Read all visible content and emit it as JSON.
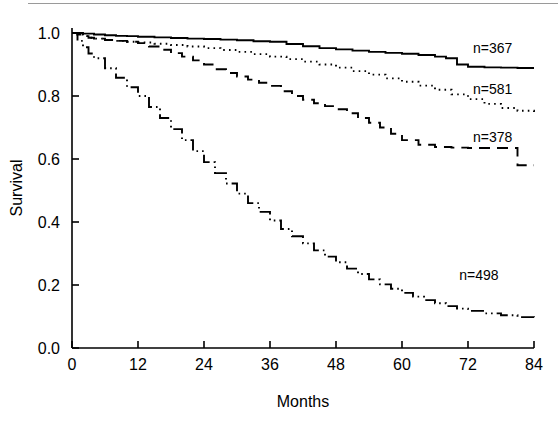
{
  "figure": {
    "type": "kaplan-meier-survival-plot",
    "background_color": "#ffffff",
    "line_color": "#000000",
    "scan_artifact_line": true
  },
  "axes": {
    "x": {
      "title": "Months",
      "min": 0,
      "max": 84,
      "ticks": [
        0,
        12,
        24,
        36,
        48,
        60,
        72,
        84
      ],
      "tick_labels": [
        "0",
        "12",
        "24",
        "36",
        "48",
        "60",
        "72",
        "84"
      ]
    },
    "y": {
      "title": "Survival",
      "min": 0.0,
      "max": 1.0,
      "ticks": [
        0.0,
        0.2,
        0.4,
        0.6,
        0.8,
        1.0
      ],
      "tick_labels": [
        "0.0",
        "0.2",
        "0.4",
        "0.6",
        "0.8",
        "1.0"
      ]
    }
  },
  "annotations": [
    {
      "id": "label-367",
      "text": "n=367",
      "x_month": 76.5,
      "y_survival": 0.935
    },
    {
      "id": "label-581",
      "text": "n=581",
      "x_month": 76.5,
      "y_survival": 0.805
    },
    {
      "id": "label-378",
      "text": "n=378",
      "x_month": 76.5,
      "y_survival": 0.655
    },
    {
      "id": "label-498",
      "text": "n=498",
      "x_month": 74.0,
      "y_survival": 0.215
    }
  ],
  "chart_data": {
    "type": "line",
    "title": "",
    "subtitle": "",
    "xlabel": "Months",
    "ylabel": "Survival",
    "xlim": [
      0,
      84
    ],
    "ylim": [
      0.0,
      1.0
    ],
    "grid": false,
    "legend_position": "inline-right-of-curves",
    "step_curves": true,
    "series": [
      {
        "name": "n=367",
        "label": "n=367",
        "n": 367,
        "line_style": "solid",
        "end_survival": 0.889,
        "x": [
          0,
          2,
          4,
          6,
          8,
          10,
          12,
          15,
          18,
          21,
          24,
          27,
          30,
          33,
          36,
          39,
          42,
          45,
          48,
          51,
          54,
          57,
          60,
          63,
          66,
          68,
          70,
          72,
          75,
          78,
          81,
          84
        ],
        "y": [
          1.0,
          0.998,
          0.995,
          0.993,
          0.991,
          0.99,
          0.988,
          0.986,
          0.984,
          0.982,
          0.981,
          0.979,
          0.977,
          0.974,
          0.972,
          0.965,
          0.958,
          0.952,
          0.948,
          0.944,
          0.94,
          0.937,
          0.934,
          0.93,
          0.925,
          0.92,
          0.9,
          0.893,
          0.891,
          0.89,
          0.889,
          0.889
        ]
      },
      {
        "name": "n=581",
        "label": "n=581",
        "n": 581,
        "line_style": "dotted",
        "end_survival": 0.746,
        "x": [
          0,
          1,
          2,
          3,
          4,
          6,
          8,
          10,
          12,
          15,
          18,
          21,
          24,
          27,
          30,
          33,
          36,
          39,
          42,
          45,
          48,
          51,
          54,
          57,
          60,
          63,
          66,
          69,
          72,
          75,
          78,
          81,
          84
        ],
        "y": [
          1.0,
          0.995,
          0.99,
          0.985,
          0.982,
          0.978,
          0.975,
          0.972,
          0.97,
          0.966,
          0.962,
          0.957,
          0.952,
          0.946,
          0.94,
          0.933,
          0.925,
          0.917,
          0.909,
          0.9,
          0.89,
          0.879,
          0.868,
          0.856,
          0.845,
          0.833,
          0.82,
          0.805,
          0.79,
          0.775,
          0.762,
          0.753,
          0.746
        ]
      },
      {
        "name": "n=378",
        "label": "n=378",
        "n": 378,
        "line_style": "dashed",
        "end_survival": 0.58,
        "x": [
          0,
          1,
          2,
          3,
          4,
          6,
          8,
          10,
          12,
          14,
          16,
          18,
          20,
          22,
          24,
          26,
          28,
          30,
          32,
          34,
          36,
          38,
          40,
          42,
          44,
          46,
          48,
          50,
          52,
          54,
          56,
          58,
          60,
          63,
          66,
          69,
          72,
          75,
          78,
          80,
          81,
          84
        ],
        "y": [
          1.0,
          0.995,
          0.99,
          0.985,
          0.982,
          0.978,
          0.975,
          0.972,
          0.968,
          0.957,
          0.947,
          0.936,
          0.925,
          0.913,
          0.9,
          0.885,
          0.873,
          0.862,
          0.852,
          0.842,
          0.832,
          0.815,
          0.8,
          0.788,
          0.777,
          0.768,
          0.758,
          0.745,
          0.73,
          0.715,
          0.7,
          0.68,
          0.66,
          0.645,
          0.638,
          0.636,
          0.635,
          0.635,
          0.635,
          0.635,
          0.58,
          0.58
        ]
      },
      {
        "name": "n=498",
        "label": "n=498",
        "n": 498,
        "line_style": "dash-dot-dot",
        "end_survival": 0.095,
        "x": [
          0,
          1,
          2,
          3,
          4,
          6,
          8,
          10,
          12,
          14,
          16,
          18,
          20,
          22,
          24,
          26,
          28,
          30,
          32,
          34,
          36,
          38,
          40,
          42,
          44,
          46,
          48,
          50,
          52,
          54,
          56,
          58,
          60,
          62,
          64,
          66,
          68,
          70,
          72,
          75,
          78,
          81,
          84
        ],
        "y": [
          1.0,
          0.975,
          0.955,
          0.935,
          0.92,
          0.888,
          0.858,
          0.828,
          0.8,
          0.765,
          0.73,
          0.695,
          0.66,
          0.625,
          0.59,
          0.555,
          0.522,
          0.49,
          0.46,
          0.432,
          0.405,
          0.378,
          0.355,
          0.332,
          0.31,
          0.29,
          0.272,
          0.252,
          0.235,
          0.218,
          0.202,
          0.188,
          0.175,
          0.163,
          0.152,
          0.142,
          0.133,
          0.125,
          0.118,
          0.11,
          0.104,
          0.098,
          0.095
        ]
      }
    ]
  }
}
